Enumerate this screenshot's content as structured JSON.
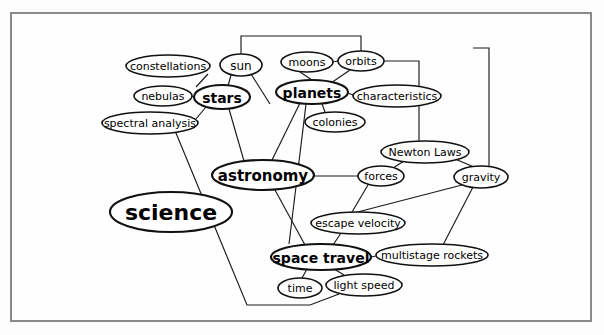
{
  "diagram": {
    "type": "concept-map",
    "background_color": "#fdfdfd",
    "frame_color": "#8a8a8a",
    "node_fill": "#ffffff",
    "node_stroke": "#111111",
    "edge_color": "#1a1a1a",
    "nodes": [
      {
        "id": "science",
        "label": "science",
        "cx": 171,
        "cy": 212,
        "rx": 61,
        "ry": 20,
        "font_size": 22,
        "weight": "bold"
      },
      {
        "id": "astronomy",
        "label": "astronomy",
        "cx": 263,
        "cy": 175,
        "rx": 51,
        "ry": 15,
        "font_size": 15,
        "weight": "bold"
      },
      {
        "id": "stars",
        "label": "stars",
        "cx": 222,
        "cy": 97,
        "rx": 28,
        "ry": 12,
        "font_size": 14,
        "weight": "bold"
      },
      {
        "id": "planets",
        "label": "planets",
        "cx": 312,
        "cy": 92,
        "rx": 36,
        "ry": 12,
        "font_size": 14,
        "weight": "bold"
      },
      {
        "id": "space-travel",
        "label": "space travel",
        "cx": 321,
        "cy": 257,
        "rx": 50,
        "ry": 13,
        "font_size": 14,
        "weight": "bold"
      },
      {
        "id": "constellations",
        "label": "constellations",
        "cx": 168,
        "cy": 66,
        "rx": 42,
        "ry": 11,
        "font_size": 11,
        "weight": "normal"
      },
      {
        "id": "nebulas",
        "label": "nebulas",
        "cx": 163,
        "cy": 96,
        "rx": 29,
        "ry": 10,
        "font_size": 11,
        "weight": "normal"
      },
      {
        "id": "spectral-analysis",
        "label": "spectral analysis",
        "cx": 150,
        "cy": 123,
        "rx": 48,
        "ry": 11,
        "font_size": 11,
        "weight": "normal"
      },
      {
        "id": "sun",
        "label": "sun",
        "cx": 241,
        "cy": 65,
        "rx": 21,
        "ry": 11,
        "font_size": 12,
        "weight": "normal"
      },
      {
        "id": "moons",
        "label": "moons",
        "cx": 307,
        "cy": 62,
        "rx": 26,
        "ry": 10,
        "font_size": 11,
        "weight": "normal"
      },
      {
        "id": "orbits",
        "label": "orbits",
        "cx": 361,
        "cy": 61,
        "rx": 23,
        "ry": 10,
        "font_size": 11,
        "weight": "normal"
      },
      {
        "id": "characteristics",
        "label": "characteristics",
        "cx": 397,
        "cy": 96,
        "rx": 44,
        "ry": 11,
        "font_size": 11,
        "weight": "normal"
      },
      {
        "id": "colonies",
        "label": "colonies",
        "cx": 335,
        "cy": 122,
        "rx": 30,
        "ry": 10,
        "font_size": 11,
        "weight": "normal"
      },
      {
        "id": "newton-laws",
        "label": "Newton Laws",
        "cx": 425,
        "cy": 152,
        "rx": 44,
        "ry": 11,
        "font_size": 11,
        "weight": "normal"
      },
      {
        "id": "forces",
        "label": "forces",
        "cx": 381,
        "cy": 176,
        "rx": 23,
        "ry": 10,
        "font_size": 11,
        "weight": "normal"
      },
      {
        "id": "gravity",
        "label": "gravity",
        "cx": 481,
        "cy": 177,
        "rx": 27,
        "ry": 11,
        "font_size": 11,
        "weight": "normal"
      },
      {
        "id": "escape-velocity",
        "label": "escape velocity",
        "cx": 358,
        "cy": 223,
        "rx": 47,
        "ry": 11,
        "font_size": 11,
        "weight": "normal"
      },
      {
        "id": "multistage-rockets",
        "label": "multistage rockets",
        "cx": 432,
        "cy": 255,
        "rx": 56,
        "ry": 11,
        "font_size": 11,
        "weight": "normal"
      },
      {
        "id": "time",
        "label": "time",
        "cx": 300,
        "cy": 288,
        "rx": 22,
        "ry": 10,
        "font_size": 11,
        "weight": "normal"
      },
      {
        "id": "light-speed",
        "label": "light speed",
        "cx": 364,
        "cy": 285,
        "rx": 38,
        "ry": 11,
        "font_size": 11,
        "weight": "normal"
      }
    ],
    "edges": [
      {
        "from": "constellations",
        "to": "stars",
        "points": "208,74 196,87"
      },
      {
        "from": "nebulas",
        "to": "stars",
        "points": "192,96 194,97"
      },
      {
        "from": "stars",
        "to": "spectral-analysis",
        "points": "206,107 190,126 175,133"
      },
      {
        "from": "stars",
        "to": "sun",
        "points": "231,75 228,86"
      },
      {
        "from": "stars",
        "to": "astronomy",
        "points": "229,109 244,161"
      },
      {
        "from": "sun",
        "to": "planets-down",
        "points": "251,74 270,104"
      },
      {
        "from": "sun",
        "to": "orbits",
        "points": "241,54 241,36 361,36 361,51"
      },
      {
        "from": "moons",
        "to": "planets",
        "points": "300,72 312,80"
      },
      {
        "from": "moons",
        "to": "orbits",
        "points": "333,62 338,61"
      },
      {
        "from": "orbits",
        "to": "planets",
        "points": "350,70 331,83"
      },
      {
        "from": "orbits",
        "to": "newton-laws",
        "points": "384,61 419,61 419,141"
      },
      {
        "from": "planets",
        "to": "characteristics",
        "points": "348,93 353,95"
      },
      {
        "from": "planets",
        "to": "colonies",
        "points": "322,104 325,112"
      },
      {
        "from": "planets",
        "to": "astronomy",
        "points": "300,103 272,160"
      },
      {
        "from": "planets",
        "to": "space-travel-long",
        "points": "306,104 289,244"
      },
      {
        "from": "astronomy",
        "to": "forces",
        "points": "314,176 358,176"
      },
      {
        "from": "astronomy",
        "to": "science",
        "points": "218,183 232,178"
      },
      {
        "from": "astronomy",
        "to": "space-travel",
        "points": "275,190 305,245"
      },
      {
        "from": "newton-laws",
        "to": "forces",
        "points": "404,161 393,168"
      },
      {
        "from": "newton-laws",
        "to": "gravity",
        "points": "455,159 474,167"
      },
      {
        "from": "gravity-top",
        "to": "topline",
        "points": "489,166 489,48 473,48"
      },
      {
        "from": "gravity",
        "to": "forces-low",
        "points": "462,185 346,215"
      },
      {
        "from": "gravity",
        "to": "multistage-rockets",
        "points": "473,187 443,245"
      },
      {
        "from": "forces",
        "to": "escape-velocity",
        "points": "368,185 352,212"
      },
      {
        "from": "escape-velocity",
        "to": "space-travel",
        "points": "341,233 333,245"
      },
      {
        "from": "space-travel",
        "to": "multistage-rockets",
        "points": "371,257 376,256"
      },
      {
        "from": "space-travel",
        "to": "time",
        "points": "307,269 302,278"
      },
      {
        "from": "space-travel",
        "to": "light-speed",
        "points": "334,269 344,275"
      },
      {
        "from": "spectral-analysis",
        "to": "light-speed-long",
        "points": "176,133 247,305 310,305 339,294"
      }
    ]
  }
}
